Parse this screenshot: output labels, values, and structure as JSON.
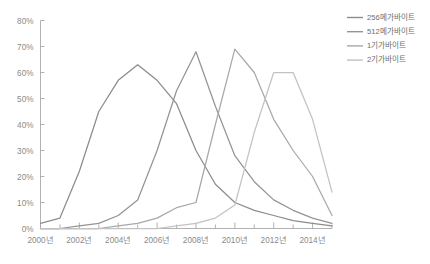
{
  "chart_data": {
    "type": "line",
    "title": "",
    "xlabel": "",
    "ylabel": "",
    "ylim": [
      0,
      80
    ],
    "ytick_labels": [
      "0%",
      "10%",
      "20%",
      "30%",
      "40%",
      "50%",
      "60%",
      "70%",
      "80%"
    ],
    "ytick_values": [
      0,
      10,
      20,
      30,
      40,
      50,
      60,
      70,
      80
    ],
    "x": [
      2000,
      2001,
      2002,
      2003,
      2004,
      2005,
      2006,
      2007,
      2008,
      2009,
      2010,
      2011,
      2012,
      2013,
      2014,
      2015
    ],
    "xtick_labels": [
      "2000년",
      "2002년",
      "2004년",
      "2006년",
      "2008년",
      "2010년",
      "2012년",
      "2014년"
    ],
    "xtick_values": [
      2000,
      2002,
      2004,
      2006,
      2008,
      2010,
      2012,
      2014
    ],
    "grid": false,
    "legend_position": "right",
    "series": [
      {
        "name": "256메가바이트",
        "color": "#8c8c8c",
        "values": [
          2,
          4,
          22,
          45,
          57,
          63,
          57,
          48,
          30,
          17,
          10,
          7,
          5,
          3,
          2,
          1
        ]
      },
      {
        "name": "512메가바이트",
        "color": "#949494",
        "values": [
          0,
          0,
          1,
          2,
          5,
          11,
          30,
          53,
          68,
          47,
          28,
          18,
          11,
          7,
          4,
          2
        ]
      },
      {
        "name": "1기가바이트",
        "color": "#a8a8a8",
        "values": [
          0,
          0,
          0,
          0,
          1,
          2,
          4,
          8,
          10,
          40,
          69,
          60,
          42,
          30,
          20,
          5
        ]
      },
      {
        "name": "2기가바이트",
        "color": "#c2c2c2",
        "values": [
          0,
          0,
          0,
          0,
          0,
          0,
          0,
          1,
          2,
          4,
          9,
          37,
          60,
          60,
          42,
          14
        ]
      }
    ]
  },
  "legend": {
    "items": [
      {
        "label": "256메가바이트",
        "color": "#8c8c8c"
      },
      {
        "label": "512메가바이트",
        "color": "#949494"
      },
      {
        "label": "1기가바이트",
        "color": "#a8a8a8"
      },
      {
        "label": "2기가바이트",
        "color": "#c2c2c2"
      }
    ]
  }
}
